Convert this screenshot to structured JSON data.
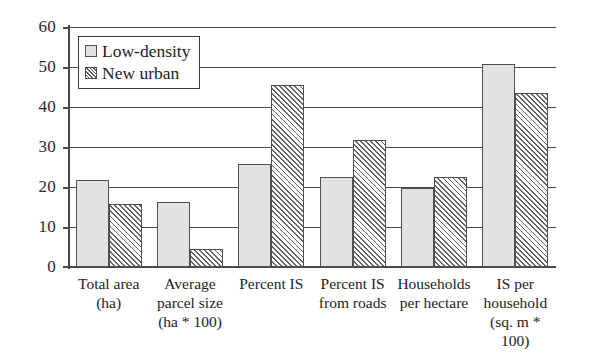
{
  "chart_data": {
    "type": "bar",
    "title": "",
    "xlabel": "",
    "ylabel": "",
    "ylim": [
      0,
      60
    ],
    "y_ticks": [
      0,
      10,
      20,
      30,
      40,
      50,
      60
    ],
    "grid": true,
    "legend_position": "top-left",
    "categories": [
      "Total area (ha)",
      "Average parcel size (ha * 100)",
      "Percent IS",
      "Percent IS from roads",
      "Households per hectare",
      "IS per household (sq. m * 100)"
    ],
    "category_lines": [
      [
        "Total area",
        "(ha)",
        ""
      ],
      [
        "Average",
        "parcel size",
        "(ha * 100)"
      ],
      [
        "Percent IS",
        "",
        ""
      ],
      [
        "Percent IS",
        "from roads",
        ""
      ],
      [
        "Households",
        "per hectare",
        ""
      ],
      [
        "IS per",
        "household",
        "(sq. m * 100)"
      ]
    ],
    "series": [
      {
        "name": "Low-density",
        "fill": "solid-light-gray",
        "color": "#e2e2e2",
        "values": [
          21.8,
          16.2,
          25.8,
          22.5,
          19.8,
          50.8
        ]
      },
      {
        "name": "New urban",
        "fill": "diagonal-hatch",
        "color": "#656565",
        "values": [
          15.7,
          4.5,
          45.5,
          31.8,
          22.4,
          43.5
        ]
      }
    ]
  },
  "axis": {
    "tick_labels": [
      "60",
      "50",
      "40",
      "30",
      "20",
      "10",
      "0"
    ]
  },
  "legend": {
    "items": [
      {
        "label": "Low-density",
        "swatch": "solid-swatch"
      },
      {
        "label": "New urban",
        "swatch": "hatch-swatch"
      }
    ]
  }
}
